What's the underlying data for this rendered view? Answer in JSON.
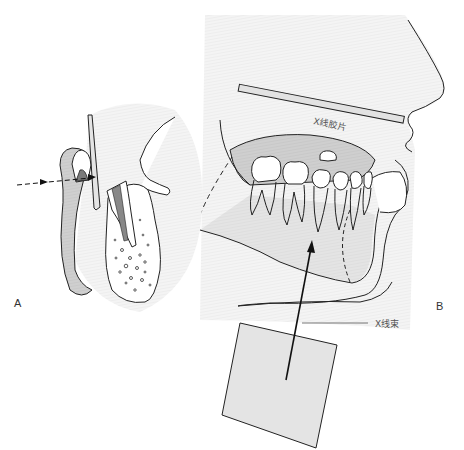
{
  "figure": {
    "panels": [
      {
        "id": "A",
        "label": "A",
        "description": "Cross-section of tooth in alveolar bone with vertical film holder and horizontal dashed X-ray direction arrow"
      },
      {
        "id": "B",
        "label": "B",
        "description": "Lateral view of jaw with occlusal X-ray film placed between teeth and X-ray beam from below"
      }
    ],
    "annotations": {
      "film_label": "X线胶片",
      "beam_label": "X线束"
    },
    "colors": {
      "stroke": "#222222",
      "bone_fill": "#c9c9c9",
      "tooth_fill": "#ffffff",
      "gum_fill": "#b8b8b8",
      "film_fill": "#e2e2e2",
      "tube_fill": "#e0e0e0",
      "background_tone": "#f2f2f2"
    }
  }
}
